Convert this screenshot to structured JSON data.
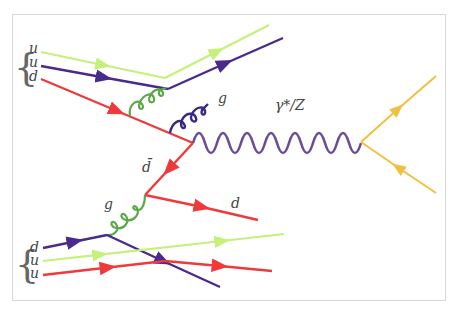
{
  "diagram": {
    "type": "feynman-diagram",
    "process": "Drell-Yan",
    "colors": {
      "quark_u_green": "#c5f07a",
      "quark_purple": "#4a2a8c",
      "quark_red": "#ee3a3a",
      "gluon_green": "#5aa84a",
      "gluon_purple": "#3a2a80",
      "boson_purple": "#6a4a9a",
      "lepton_yellow": "#f0c040",
      "frame": "#d8d8d8"
    },
    "labels": {
      "top_proton_q1": "u",
      "top_proton_q2": "u",
      "top_proton_q3": "d",
      "bottom_proton_q1": "d",
      "bottom_proton_q2": "u",
      "bottom_proton_q3": "u",
      "gluon_top": "g",
      "gluon_bottom": "g",
      "boson": "γ*/Z",
      "antiquark": "d̄",
      "outgoing_quark": "d"
    },
    "top_proton": {
      "label": "{u u d}",
      "quarks": [
        "u",
        "u",
        "d"
      ]
    },
    "bottom_proton": {
      "label": "{d u u}",
      "quarks": [
        "d",
        "u",
        "u"
      ]
    },
    "propagators": [
      {
        "type": "fermion",
        "name": "u (green, top)",
        "color": "quark_u_green"
      },
      {
        "type": "fermion",
        "name": "u (purple, top)",
        "color": "quark_purple"
      },
      {
        "type": "fermion",
        "name": "d (red, top)",
        "color": "quark_red"
      },
      {
        "type": "gluon",
        "name": "g (green, top)",
        "color": "gluon_green"
      },
      {
        "type": "gluon",
        "name": "g (purple, emitted)",
        "color": "gluon_purple"
      },
      {
        "type": "photon",
        "name": "γ*/Z",
        "color": "boson_purple"
      },
      {
        "type": "fermion",
        "name": "lepton out",
        "color": "lepton_yellow"
      },
      {
        "type": "fermion",
        "name": "antilepton out",
        "color": "lepton_yellow"
      },
      {
        "type": "fermion",
        "name": "d̄",
        "color": "quark_red"
      },
      {
        "type": "gluon",
        "name": "g (green, bottom)",
        "color": "gluon_green"
      },
      {
        "type": "fermion",
        "name": "d (red, out)",
        "color": "quark_red"
      },
      {
        "type": "fermion",
        "name": "d (purple, bottom)",
        "color": "quark_purple"
      },
      {
        "type": "fermion",
        "name": "u (green, bottom)",
        "color": "quark_u_green"
      },
      {
        "type": "fermion",
        "name": "u (red, bottom)",
        "color": "quark_red"
      }
    ]
  }
}
